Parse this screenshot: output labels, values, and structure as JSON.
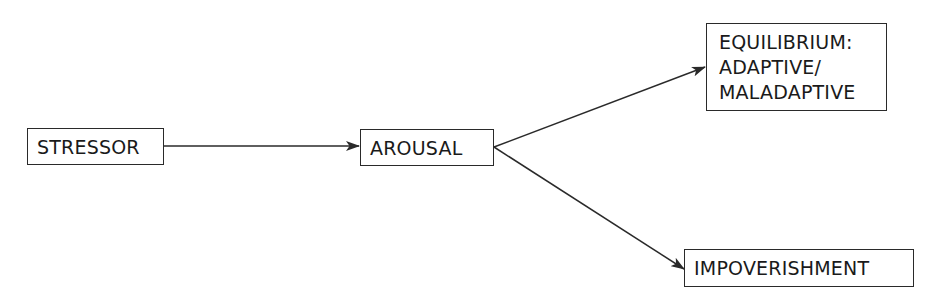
{
  "diagram": {
    "type": "flowchart",
    "nodes": {
      "stressor": {
        "label": "STRESSOR"
      },
      "arousal": {
        "label": "AROUSAL"
      },
      "equilibrium": {
        "lines": [
          "EQUILIBRIUM:",
          "ADAPTIVE/",
          "MALADAPTIVE"
        ]
      },
      "impoverishment": {
        "label": "IMPOVERISHMENT"
      }
    },
    "edges": [
      {
        "from": "STRESSOR",
        "to": "AROUSAL"
      },
      {
        "from": "AROUSAL",
        "to": "EQUILIBRIUM: ADAPTIVE/ MALADAPTIVE"
      },
      {
        "from": "AROUSAL",
        "to": "IMPOVERISHMENT"
      }
    ],
    "colors": {
      "stroke": "#2a2a2a",
      "text": "#1a1a1a",
      "background": "#ffffff"
    }
  }
}
